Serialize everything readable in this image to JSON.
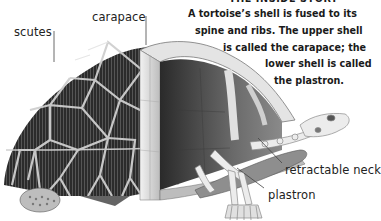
{
  "diagram": {
    "heading": "THE INSIDE STORY",
    "caption_lines": [
      "A tortoise’s shell is fused to its",
      "spine and ribs. The upper shell",
      "is called the carapace; the",
      "lower shell is called",
      "the plastron."
    ],
    "labels": {
      "scutes": "scutes",
      "carapace": "carapace",
      "retractable_neck": "retractable neck",
      "plastron": "plastron"
    },
    "colors": {
      "shell_dark": "#2e2e2e",
      "shell_light": "#d8d8d8",
      "bone": "#e9e9e9",
      "interior": "#5a5a5a",
      "leader_line": "#444444"
    }
  }
}
